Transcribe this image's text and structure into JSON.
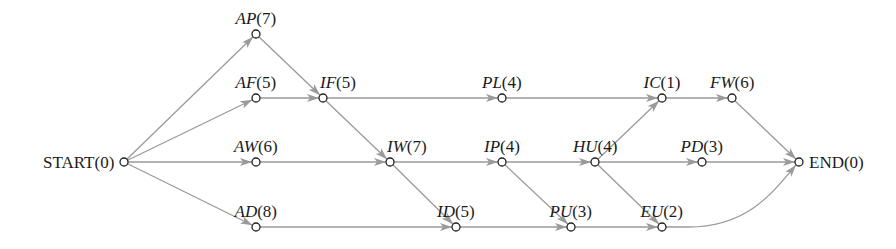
{
  "diagram": {
    "type": "activity-network",
    "colors": {
      "edge": "#9a9a9a",
      "node_stroke": "#222222",
      "text": "#1a1a1a",
      "background": "#ffffff"
    },
    "nodes": [
      {
        "id": "START",
        "code": "START",
        "duration": "(0)",
        "x": 124,
        "y": 162,
        "label_pos": "left",
        "italic": false
      },
      {
        "id": "AP",
        "code": "AP",
        "duration": "(7)",
        "x": 256,
        "y": 34,
        "label_pos": "above",
        "italic": true
      },
      {
        "id": "AF",
        "code": "AF",
        "duration": "(5)",
        "x": 256,
        "y": 98,
        "label_pos": "above",
        "italic": true
      },
      {
        "id": "AW",
        "code": "AW",
        "duration": "(6)",
        "x": 256,
        "y": 162,
        "label_pos": "above",
        "italic": true
      },
      {
        "id": "AD",
        "code": "AD",
        "duration": "(8)",
        "x": 256,
        "y": 227,
        "label_pos": "above",
        "italic": true
      },
      {
        "id": "IF",
        "code": "IF",
        "duration": "(5)",
        "x": 323,
        "y": 98,
        "label_pos": "above-right",
        "italic": true
      },
      {
        "id": "PL",
        "code": "PL",
        "duration": "(4)",
        "x": 502,
        "y": 98,
        "label_pos": "above",
        "italic": true
      },
      {
        "id": "IW",
        "code": "IW",
        "duration": "(7)",
        "x": 390,
        "y": 162,
        "label_pos": "above-right",
        "italic": true
      },
      {
        "id": "IP",
        "code": "IP",
        "duration": "(4)",
        "x": 502,
        "y": 162,
        "label_pos": "above",
        "italic": true
      },
      {
        "id": "HU",
        "code": "HU",
        "duration": "(4)",
        "x": 595,
        "y": 162,
        "label_pos": "above",
        "italic": true
      },
      {
        "id": "ID",
        "code": "ID",
        "duration": "(5)",
        "x": 456,
        "y": 227,
        "label_pos": "above",
        "italic": true
      },
      {
        "id": "PU",
        "code": "PU",
        "duration": "(3)",
        "x": 571,
        "y": 227,
        "label_pos": "above",
        "italic": true
      },
      {
        "id": "EU",
        "code": "EU",
        "duration": "(2)",
        "x": 662,
        "y": 227,
        "label_pos": "above",
        "italic": true
      },
      {
        "id": "IC",
        "code": "IC",
        "duration": "(1)",
        "x": 662,
        "y": 98,
        "label_pos": "above",
        "italic": true
      },
      {
        "id": "FW",
        "code": "FW",
        "duration": "(6)",
        "x": 732,
        "y": 98,
        "label_pos": "above",
        "italic": true
      },
      {
        "id": "PD",
        "code": "PD",
        "duration": "(3)",
        "x": 702,
        "y": 162,
        "label_pos": "above",
        "italic": true
      },
      {
        "id": "END",
        "code": "END",
        "duration": "(0)",
        "x": 799,
        "y": 162,
        "label_pos": "right",
        "italic": false
      }
    ],
    "edges": [
      {
        "from": "START",
        "to": "AP"
      },
      {
        "from": "START",
        "to": "AF"
      },
      {
        "from": "START",
        "to": "AW"
      },
      {
        "from": "START",
        "to": "AD"
      },
      {
        "from": "AP",
        "to": "IF"
      },
      {
        "from": "AF",
        "to": "IF"
      },
      {
        "from": "IF",
        "to": "PL"
      },
      {
        "from": "IF",
        "to": "IW"
      },
      {
        "from": "AW",
        "to": "IW"
      },
      {
        "from": "AD",
        "to": "ID"
      },
      {
        "from": "IW",
        "to": "IP"
      },
      {
        "from": "IW",
        "to": "ID"
      },
      {
        "from": "PL",
        "to": "IC"
      },
      {
        "from": "IP",
        "to": "HU"
      },
      {
        "from": "IP",
        "to": "PU"
      },
      {
        "from": "ID",
        "to": "PU"
      },
      {
        "from": "HU",
        "to": "IC"
      },
      {
        "from": "HU",
        "to": "PD"
      },
      {
        "from": "HU",
        "to": "EU"
      },
      {
        "from": "PU",
        "to": "EU"
      },
      {
        "from": "IC",
        "to": "FW"
      },
      {
        "from": "FW",
        "to": "END"
      },
      {
        "from": "PD",
        "to": "END"
      },
      {
        "from": "EU",
        "to": "END",
        "curved": true
      }
    ]
  }
}
